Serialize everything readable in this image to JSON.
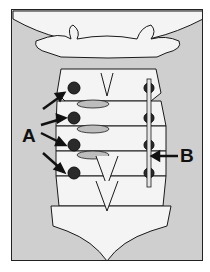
{
  "figure": {
    "labels": {
      "a": "A",
      "b": "B"
    },
    "colors": {
      "background": "#cfcfcf",
      "bone": "#f4f4f4",
      "outline": "#1a1a1a",
      "screw": "#2a2a2a",
      "disc": "#bdbdbd"
    }
  }
}
